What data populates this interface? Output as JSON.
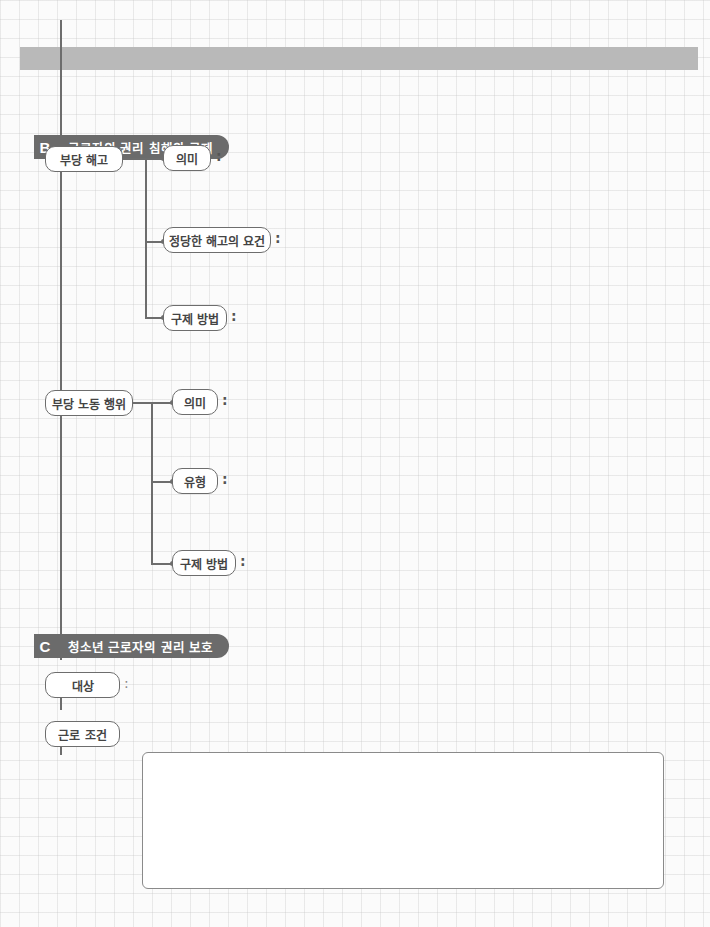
{
  "header_bar": {
    "color": "#b9b9b9"
  },
  "section_b": {
    "letter": "B",
    "title": "근로자의 권리 침해와 구제",
    "items": [
      {
        "label": "부당 해고",
        "children": [
          {
            "label": "의미",
            "colon": ":"
          },
          {
            "label": "정당한 해고의 요건",
            "colon": ":"
          },
          {
            "label": "구제 방법",
            "colon": ":"
          }
        ]
      },
      {
        "label": "부당 노동 행위",
        "children": [
          {
            "label": "의미",
            "colon": ":"
          },
          {
            "label": "유형",
            "colon": ":"
          },
          {
            "label": "구제 방법",
            "colon": ":"
          }
        ]
      }
    ]
  },
  "section_c": {
    "letter": "C",
    "title": "청소년 근로자의 권리 보호",
    "items": [
      {
        "label": "대상",
        "colon": ":"
      },
      {
        "label": "근로 조건",
        "answer": ""
      }
    ]
  }
}
